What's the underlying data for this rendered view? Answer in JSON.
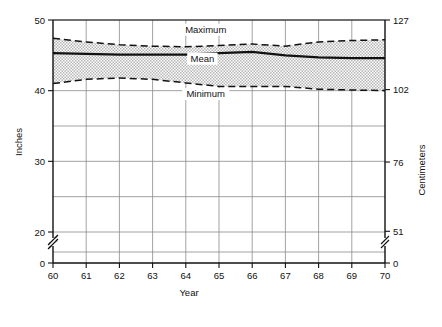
{
  "chart_data": {
    "type": "line",
    "title": "",
    "xlabel": "Year",
    "ylabel": "Inches",
    "ylabel_right": "Centimeters",
    "xlim": [
      60,
      70
    ],
    "ylim": [
      0,
      50
    ],
    "ylim_right": [
      0,
      127
    ],
    "grid": true,
    "axis_break": {
      "left": {
        "between": [
          0,
          20
        ]
      },
      "right": {
        "between": [
          0,
          51
        ]
      }
    },
    "x_ticks": [
      "60",
      "61",
      "62",
      "63",
      "64",
      "65",
      "66",
      "67",
      "68",
      "69",
      "70"
    ],
    "x_tick_values": [
      60,
      61,
      62,
      63,
      64,
      65,
      66,
      67,
      68,
      69,
      70
    ],
    "y_ticks_left": [
      "50",
      "40",
      "30",
      "20",
      "0"
    ],
    "y_tick_values_left": [
      50,
      40,
      30,
      20,
      0
    ],
    "y_gridlines_left": [
      50,
      45,
      40,
      35,
      30,
      25,
      20
    ],
    "y_ticks_right": [
      "127",
      "102",
      "76",
      "51",
      "0"
    ],
    "y_tick_values_right": [
      127,
      102,
      76,
      51,
      0
    ],
    "legend_position": "inline-annotations",
    "x": [
      60,
      61,
      62,
      63,
      64,
      65,
      66,
      67,
      68,
      69,
      70
    ],
    "series": [
      {
        "name": "Maximum",
        "style": "dashed",
        "values": [
          47.4,
          46.9,
          46.5,
          46.3,
          46.2,
          46.4,
          46.6,
          46.3,
          46.9,
          47.1,
          47.2
        ]
      },
      {
        "name": "Mean",
        "style": "solid",
        "values": [
          45.3,
          45.2,
          45.1,
          45.1,
          45.1,
          45.3,
          45.5,
          45.0,
          44.7,
          44.6,
          44.6
        ]
      },
      {
        "name": "Minimum",
        "style": "dashed",
        "values": [
          41.0,
          41.6,
          41.8,
          41.6,
          41.1,
          40.6,
          40.6,
          40.6,
          40.2,
          40.1,
          40.0
        ]
      }
    ],
    "band": {
      "fill": "stippled-gray",
      "upper_series": "Maximum",
      "lower_series": "Minimum"
    },
    "annotations": [
      {
        "text": "Maximum",
        "x": 64.6,
        "y": 48.2
      },
      {
        "text": "Mean",
        "x": 64.5,
        "y": 44.1
      },
      {
        "text": "Minimum",
        "x": 64.6,
        "y": 39.1
      }
    ]
  },
  "colors": {
    "line": "#111111",
    "grid": "#8a8a8a",
    "axis": "#111111",
    "band_fill": "#d4d4d4",
    "background": "#ffffff"
  }
}
